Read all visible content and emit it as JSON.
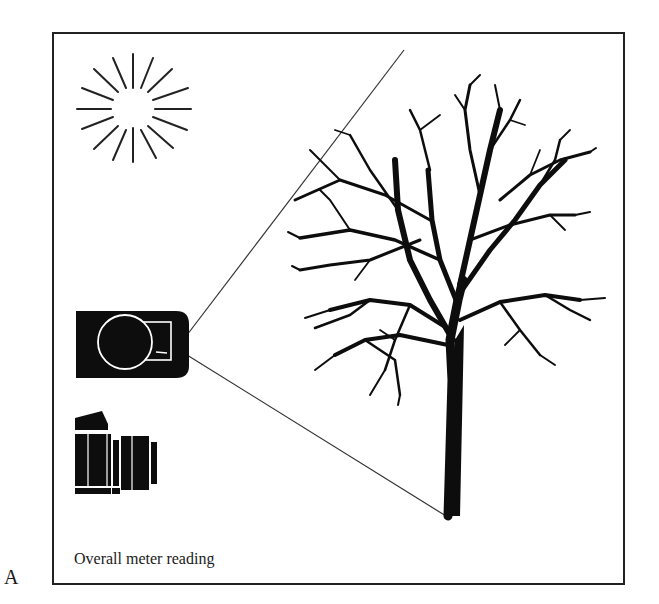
{
  "figure": {
    "panel_label": "A",
    "caption": "Overall meter reading"
  },
  "elements": {
    "sun": "sun-icon",
    "meter": "light-meter-icon",
    "camera": "camera-icon",
    "subject": "tree-illustration",
    "view_lines": "meter-angle-of-view-lines"
  },
  "colors": {
    "ink": "#111111",
    "background": "#ffffff"
  }
}
